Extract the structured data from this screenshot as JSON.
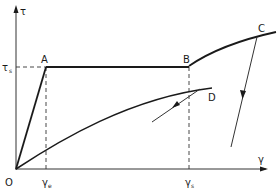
{
  "diagram": {
    "axes": {
      "y_label": "τ",
      "x_label": "γ",
      "origin_label": "O"
    },
    "levels": {
      "tau_s_label": "τ",
      "tau_s_sub": "s",
      "gamma_e_label": "γ",
      "gamma_e_sub": "e",
      "gamma_s_label": "γ",
      "gamma_s_sub": "s"
    },
    "points": {
      "A": "A",
      "B": "B",
      "C": "C",
      "D": "D"
    },
    "segments": [
      {
        "name": "elastic",
        "from": "O",
        "to": "A",
        "shape": "straight"
      },
      {
        "name": "plateau",
        "from": "A",
        "to": "B",
        "shape": "horizontal"
      },
      {
        "name": "hardening",
        "from": "B",
        "to": "C",
        "shape": "concave curve"
      },
      {
        "name": "unloading-from-C",
        "from": "C",
        "shape": "straight with arrow"
      },
      {
        "name": "loading-curve",
        "from": "O",
        "to": "D",
        "shape": "concave curve"
      },
      {
        "name": "unloading-from-D",
        "from": "D",
        "shape": "straight with arrow"
      }
    ]
  }
}
